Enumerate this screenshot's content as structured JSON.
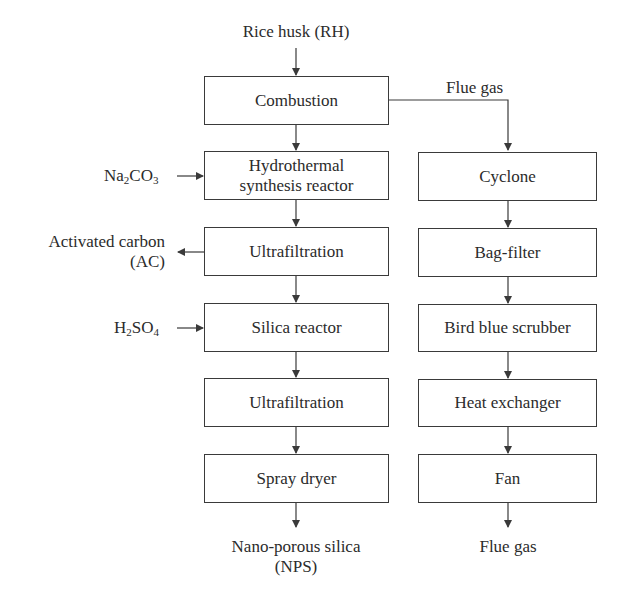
{
  "diagram": {
    "type": "process-flowchart",
    "inputs": {
      "top": "Rice husk (RH)",
      "na2co3": {
        "base1": "Na",
        "sub1": "2",
        "base2": "CO",
        "sub2": "3"
      },
      "h2so4": {
        "base1": "H",
        "sub1": "2",
        "base2": "SO",
        "sub2": "4"
      }
    },
    "side_outputs": {
      "activated_carbon_line1": "Activated carbon",
      "activated_carbon_line2": "(AC)"
    },
    "left_column": [
      {
        "id": "combustion",
        "label": "Combustion"
      },
      {
        "id": "hydrothermal",
        "label_line1": "Hydrothermal",
        "label_line2": "synthesis reactor"
      },
      {
        "id": "ultrafiltration-1",
        "label": "Ultrafiltration"
      },
      {
        "id": "silica-reactor",
        "label": "Silica reactor"
      },
      {
        "id": "ultrafiltration-2",
        "label": "Ultrafiltration"
      },
      {
        "id": "spray-dryer",
        "label": "Spray dryer"
      }
    ],
    "right_column": [
      {
        "id": "cyclone",
        "label": "Cyclone"
      },
      {
        "id": "bag-filter",
        "label": "Bag-filter"
      },
      {
        "id": "scrubber",
        "label": "Bird blue scrubber"
      },
      {
        "id": "heat-exchanger",
        "label": "Heat exchanger"
      },
      {
        "id": "fan",
        "label": "Fan"
      }
    ],
    "connector_labels": {
      "flue_gas_branch": "Flue gas"
    },
    "outputs": {
      "nps_line1": "Nano-porous silica",
      "nps_line2": "(NPS)",
      "flue_gas_out": "Flue gas"
    },
    "colors": {
      "line": "#3a3a3a",
      "text": "#2b2b2b",
      "background": "#ffffff"
    }
  }
}
